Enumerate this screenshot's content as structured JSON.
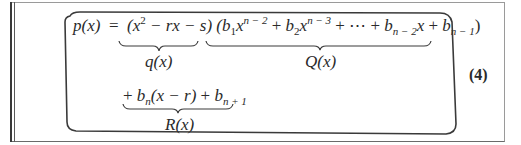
{
  "equation": {
    "number": "(4)",
    "line1": {
      "lhs": "p(x)",
      "equals": "=",
      "q_factor": {
        "open": "(x",
        "exp": "2",
        "rest": " − rx − s)"
      },
      "Q_factor": {
        "t1_open": "(b",
        "t1_sub": "1",
        "t1_var": "x",
        "t1_exp": "n − 2",
        "plus1": " + ",
        "t2_b": "b",
        "t2_sub": "2",
        "t2_var": "x",
        "t2_exp": "n − 3",
        "plus2": " + ",
        "dots": "⋯",
        "plus3": " + ",
        "t3_b": "b",
        "t3_sub": "n − 2",
        "t3_var": "x",
        "plus4": " + ",
        "t4_b": "b",
        "t4_sub": "n − 1",
        "close": ")"
      }
    },
    "line2": {
      "plus_lead": "+ ",
      "t1_b": "b",
      "t1_sub": "n",
      "t1_rest": "(x − r)",
      "plus": " + ",
      "t2_b": "b",
      "t2_sub": "n + 1"
    },
    "brace_labels": {
      "q": "q(x)",
      "Q": "Q(x)",
      "R": "R(x)"
    }
  }
}
